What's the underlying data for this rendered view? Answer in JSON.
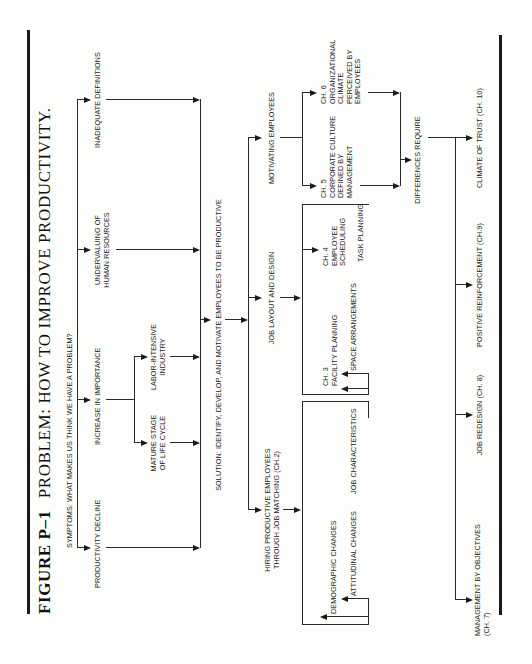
{
  "figure": {
    "number": "FIGURE P–1",
    "title": "PROBLEM: HOW TO IMPROVE PRODUCTIVITY."
  },
  "symptoms": {
    "heading": "SYMPTOMS: WHAT MAKES US THINK WE HAVE A PROBLEM?",
    "items": [
      {
        "label": "PRODUCTIVITY DECLINE"
      },
      {
        "label": "INCREASE IN IMPORTANCE",
        "children": [
          {
            "label": "MATURE STAGE\nOF LIFE CYCLE"
          },
          {
            "label": "LABOR-INTENSIVE\nINDUSTRY"
          }
        ]
      },
      {
        "label": "UNDERVALUING OF\nHUMAN RESOURCES"
      },
      {
        "label": "INADEQUATE DEFINITIONS"
      }
    ]
  },
  "solution": {
    "label": "SOLUTION: IDENTIFY, DEVELOP, AND MOTIVATE EMPLOYEES TO BE PRODUCTIVE",
    "branches": [
      {
        "label": "HIRING PRODUCTIVE EMPLOYEES\nTHROUGH JOB MATCHING (CH.2)",
        "inputs": [
          "DEMOGRAPHIC CHANGES",
          "ATTITUDINAL CHANGES",
          "JOB CHARACTERISTICS"
        ]
      },
      {
        "label": "JOB LAYOUT AND DESIGN",
        "children": [
          {
            "label": "CH. 3\nFACILITY PLANNING"
          },
          {
            "label": "SPACE ARRANGEMENTS"
          },
          {
            "label": "CH. 4\nEMPLOYEE\nSCHEDULING"
          },
          {
            "label": "TASK PLANNING"
          }
        ]
      },
      {
        "label": "MOTIVATING EMPLOYEES",
        "children": [
          {
            "label": "CH. 5\nCORPORATE CULTURE\nDEFINED BY\nMANAGEMENT"
          },
          {
            "label": "CH. 6\nORGANIZATIONAL\nCLIMATE\nPERCEIVED BY\nEMPLOYEES"
          }
        ]
      }
    ]
  },
  "differences": {
    "label": "DIFFERENCES REQUIRE",
    "outcomes": [
      {
        "label": "MANAGEMENT BY OBJECTIVES\n(CH. 7)"
      },
      {
        "label": "JOB REDESIGN (CH. 8)"
      },
      {
        "label": "POSITIVE REINFORCEMENT (CH.9)"
      },
      {
        "label": "CLIMATE OF TRUST (CH. 10)"
      }
    ]
  }
}
